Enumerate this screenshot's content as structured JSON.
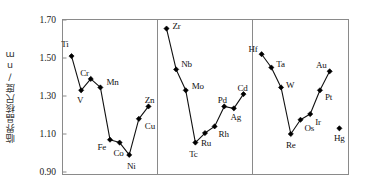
{
  "chart_data": {
    "type": "line",
    "title": "",
    "subtitle": "",
    "xlabel": "",
    "ylabel": "临界晶核尺度/nm",
    "ylim": [
      0.9,
      1.7
    ],
    "yticks": [
      "0.90",
      "1.10",
      "1.30",
      "1.50",
      "1.70"
    ],
    "ytick_values": [
      0.9,
      1.1,
      1.3,
      1.5,
      1.7
    ],
    "grid": false,
    "legend": "none",
    "xaxis_ticks": "none",
    "panels": [
      {
        "name": "3d-series",
        "points": [
          {
            "label": "Ti",
            "value": 1.51
          },
          {
            "label": "V",
            "value": 1.33
          },
          {
            "label": "Cr",
            "value": 1.39
          },
          {
            "label": "Mn",
            "value": 1.345
          },
          {
            "label": "Fe",
            "value": 1.07
          },
          {
            "label": "Co",
            "value": 1.055
          },
          {
            "label": "Ni",
            "value": 0.99
          },
          {
            "label": "Cu",
            "value": 1.18
          },
          {
            "label": "Zn",
            "value": 1.245
          }
        ]
      },
      {
        "name": "4d-series",
        "points": [
          {
            "label": "Zr",
            "value": 1.655
          },
          {
            "label": "Nb",
            "value": 1.44
          },
          {
            "label": "Mo",
            "value": 1.33
          },
          {
            "label": "Tc",
            "value": 1.055
          },
          {
            "label": "Ru",
            "value": 1.105
          },
          {
            "label": "Rh",
            "value": 1.14
          },
          {
            "label": "Pd",
            "value": 1.245
          },
          {
            "label": "Ag",
            "value": 1.235
          },
          {
            "label": "Cd",
            "value": 1.31
          }
        ]
      },
      {
        "name": "5d-series",
        "points": [
          {
            "label": "Hf",
            "value": 1.52
          },
          {
            "label": "Ta",
            "value": 1.45
          },
          {
            "label": "W",
            "value": 1.345
          },
          {
            "label": "Re",
            "value": 1.1
          },
          {
            "label": "Os",
            "value": 1.175
          },
          {
            "label": "Ir",
            "value": 1.205
          },
          {
            "label": "Pt",
            "value": 1.33
          },
          {
            "label": "Au",
            "value": 1.43
          },
          {
            "label": "Hg",
            "value": 1.13,
            "isolated": true
          }
        ]
      }
    ],
    "colors": {
      "line": "#111111",
      "marker": "#000000",
      "frame": "#8a8a8a",
      "text": "#1a1a1a",
      "background": "#ffffff"
    }
  }
}
